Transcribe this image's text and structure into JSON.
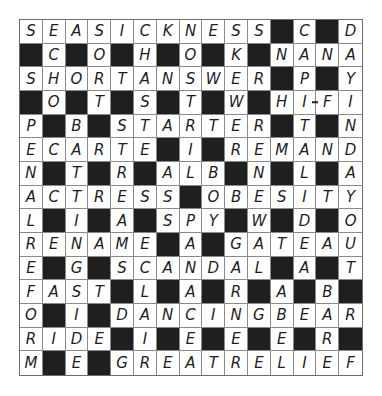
{
  "puzzle": {
    "type": "crossword",
    "rows": 15,
    "cols": 15,
    "black_color": "#1f1f1f",
    "grid": [
      "SEASICKNESS#C#D",
      "#C#O#H#O#K#NANA",
      "SHORTANSWER#P#Y",
      "#O#T#S#T#W#HIFI",
      "P#B#STARTER#T#N",
      "ECARTE#I#REMAND",
      "N#T#R#ALB#N#L#A",
      "ACTRESS#OBESITY",
      "L#I#A#SPY#W#D#O",
      "RENAME#A#GATEAU",
      "E#G#SCANDAL#A#T",
      "FAST#L#A#R#A#B#",
      "O#I#DANCINGBEAR",
      "RIDE#I#E#E#E#R#",
      "M#E#GREATRELIEF"
    ],
    "hyphens": [
      {
        "row": 3,
        "col": 13
      }
    ]
  }
}
